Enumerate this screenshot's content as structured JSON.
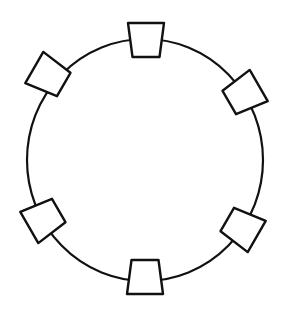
{
  "diagram": {
    "background": "#ffffff",
    "stroke_color": "#111111",
    "ring": {
      "cx": 145,
      "cy": 160,
      "rx": 118,
      "ry": 121
    },
    "node_shape": "trapezoid",
    "nodes": [
      {
        "id": "top",
        "cx": 146,
        "cy": 40,
        "rotate": 0
      },
      {
        "id": "upper-right",
        "cx": 244,
        "cy": 94,
        "rotate": 60
      },
      {
        "id": "lower-right",
        "cx": 242,
        "cy": 228,
        "rotate": 120
      },
      {
        "id": "bottom",
        "cx": 145,
        "cy": 277,
        "rotate": 180
      },
      {
        "id": "lower-left",
        "cx": 44,
        "cy": 219,
        "rotate": 240
      },
      {
        "id": "upper-left",
        "cx": 49,
        "cy": 76,
        "rotate": 300
      }
    ]
  }
}
